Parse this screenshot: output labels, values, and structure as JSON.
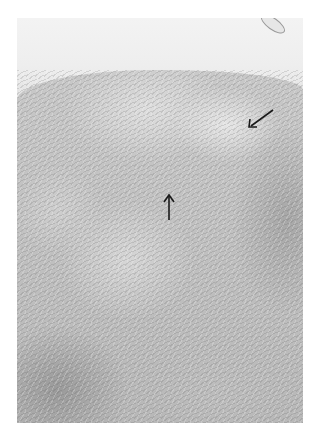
{
  "image": {
    "kind": "histology micrograph",
    "colorspace": "grayscale",
    "annotations": [
      {
        "type": "arrow",
        "direction": "down-left",
        "x": 254,
        "y": 117
      },
      {
        "type": "arrow",
        "direction": "up",
        "x": 168,
        "y": 205
      }
    ],
    "colors": {
      "background": "#ffffff",
      "tissue_mid": "#c4c4c4",
      "arrow": "#1a1a1a"
    }
  }
}
